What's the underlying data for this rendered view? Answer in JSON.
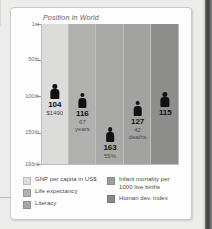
{
  "chart_data": {
    "type": "bar",
    "title": "Position in World",
    "xlabel": "",
    "ylabel": "",
    "ylim": [
      1,
      193
    ],
    "y_inverted": true,
    "grid": true,
    "legend_position": "bottom",
    "y_ticks": [
      "1st",
      "50th",
      "100th",
      "150th",
      "193rd"
    ],
    "y_tick_values": [
      1,
      50,
      100,
      150,
      193
    ],
    "categories": [
      "GNP per capita in US$",
      "Life expectancy",
      "Literacy",
      "Infant mortality per 1000 live births",
      "Human dev. index"
    ],
    "values": [
      104,
      116,
      163,
      127,
      115
    ],
    "value_labels": [
      "104",
      "116",
      "163",
      "127",
      "115"
    ],
    "secondary_labels": [
      "$1490",
      "67 years",
      "55%",
      "42 deaths",
      ""
    ],
    "secondary_lines": [
      [
        "$1490"
      ],
      [
        "67",
        "years"
      ],
      [
        "55%"
      ],
      [
        "42",
        "deaths"
      ],
      []
    ],
    "column_colors": [
      "#dcdcda",
      "#b0b0ae",
      "#a9a9a7",
      "#a2a2a0",
      "#8e8e8c"
    ],
    "marker_color": "#111111"
  },
  "card": {
    "title": "Position in World"
  },
  "legend": {
    "left": [
      {
        "label": "GNP per capita in US$",
        "color": "#dcdcda"
      },
      {
        "label": "Life expectancy",
        "color": "#b0b0ae"
      },
      {
        "label": "Literacy",
        "color": "#a6a6a4"
      }
    ],
    "right": [
      {
        "label": "Infant mortality per",
        "label2": "1000 live births",
        "color": "#9e9e9c"
      },
      {
        "label": "Human dev. index",
        "label2": "",
        "color": "#8a8a88"
      }
    ]
  }
}
